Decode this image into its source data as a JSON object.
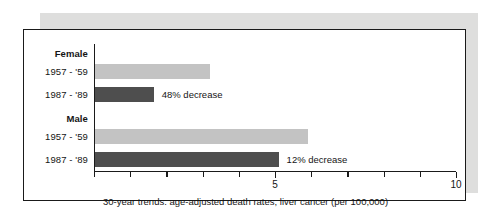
{
  "figure": {
    "caption": "30-year trends: age-adjusted death rates, liver cancer (per 100,000)"
  },
  "chart_data": {
    "type": "bar",
    "orientation": "horizontal",
    "title": "",
    "subtitle": "",
    "caption": "30-year trends: age-adjusted death rates, liver cancer (per 100,000)",
    "xlabel": "",
    "ylabel": "",
    "xlim": [
      0,
      10
    ],
    "xticks": [
      0,
      1,
      2,
      3,
      4,
      5,
      6,
      7,
      8,
      9,
      10
    ],
    "xtick_labels": [
      "",
      "",
      "",
      "",
      "",
      "5",
      "",
      "",
      "",
      "",
      "10"
    ],
    "grid": false,
    "legend": "none",
    "groups": [
      {
        "name": "Female",
        "bars": [
          {
            "category": "1957 - '59",
            "period": "1957 - '59",
            "value": 3.2,
            "style": "light",
            "color": "#c3c3c3",
            "annotation": ""
          },
          {
            "category": "1987 - '89",
            "period": "1987 - '89",
            "value": 1.65,
            "style": "dark",
            "color": "#4e4e4e",
            "annotation": "48% decrease"
          }
        ]
      },
      {
        "name": "Male",
        "bars": [
          {
            "category": "1957 - '59",
            "period": "1957 - '59",
            "value": 5.9,
            "style": "light",
            "color": "#c3c3c3",
            "annotation": ""
          },
          {
            "category": "1987 - '89",
            "period": "1987 - '89",
            "value": 5.1,
            "style": "dark",
            "color": "#4e4e4e",
            "annotation": "12% decrease"
          }
        ]
      }
    ]
  }
}
